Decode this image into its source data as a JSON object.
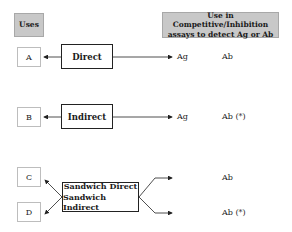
{
  "headers": {
    "uses": "Uses",
    "competitive": "Use in Competitive/Inhibition assays to detect Ag or Ab"
  },
  "rows": [
    {
      "use": "A",
      "method": "Direct",
      "target": "Ag",
      "competitive": "Ab"
    },
    {
      "use": "B",
      "method": "Indirect",
      "target": "Ag",
      "competitive": "Ab (*)"
    }
  ],
  "sandwich": {
    "uses": [
      "C",
      "D"
    ],
    "methods": [
      "Sandwich Direct",
      "Sandwich Indirect"
    ],
    "competitive": [
      "Ab",
      "Ab (*)"
    ]
  }
}
